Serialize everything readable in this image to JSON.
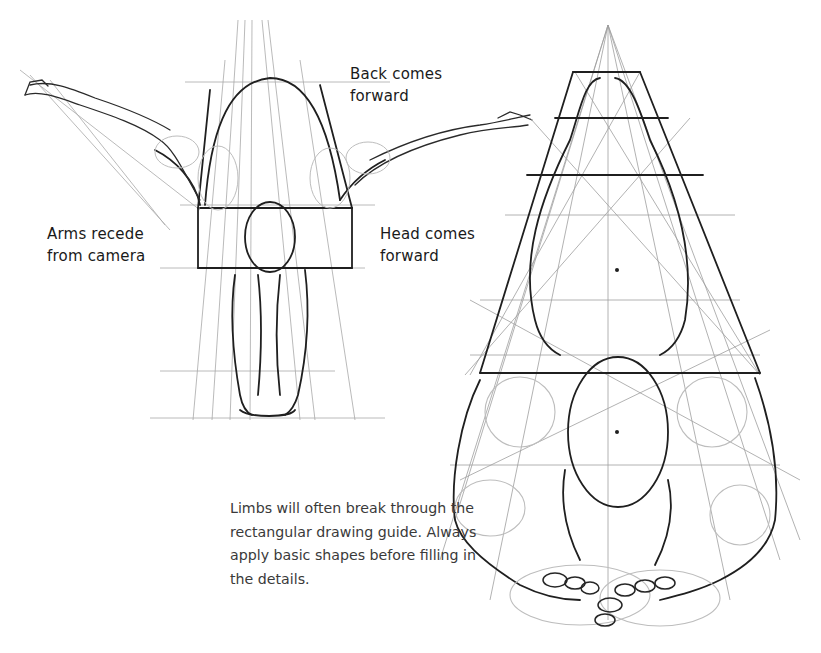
{
  "figures": {
    "left": {
      "description": "Figure bent forward viewed from front, arms outstretched, enclosed in rectangular perspective guide"
    },
    "right": {
      "description": "Figure viewed from above in steep foreshortening, enclosed in tapering perspective guide with construction lines"
    }
  },
  "annotations": {
    "back": {
      "line1": "Back comes",
      "line2": "forward"
    },
    "arms": {
      "line1": "Arms recede",
      "line2": "from camera"
    },
    "head": {
      "line1": "Head comes",
      "line2": "forward"
    }
  },
  "caption": {
    "line1": "Limbs will often break through the",
    "line2": "rectangular drawing guide. Always",
    "line3": "apply basic shapes before filling in",
    "line4": "the details."
  },
  "colors": {
    "ink": "#1a1a1a",
    "pencil": "#9a9a9a",
    "caption": "#3a3a3a",
    "background": "#ffffff"
  }
}
